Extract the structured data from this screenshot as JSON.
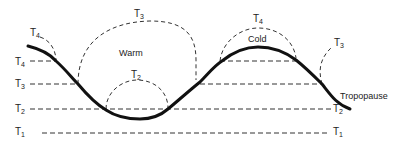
{
  "diagram": {
    "curve_label": "Tropopause",
    "region_warm": "Warm",
    "region_cold": "Cold",
    "levels": [
      {
        "id": "T1",
        "base": "T",
        "sub": "1"
      },
      {
        "id": "T2",
        "base": "T",
        "sub": "2"
      },
      {
        "id": "T3",
        "base": "T",
        "sub": "3"
      },
      {
        "id": "T4",
        "base": "T",
        "sub": "4"
      }
    ],
    "colors": {
      "line": "#111111",
      "text": "#222222",
      "background": "#ffffff"
    }
  }
}
